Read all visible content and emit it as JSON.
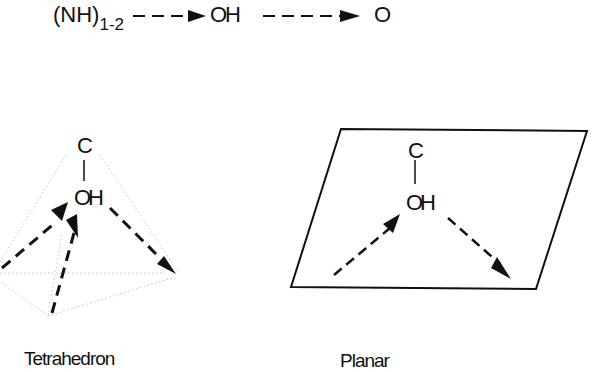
{
  "top_chain": {
    "donor": "(NH)",
    "donor_subscript": "1-2",
    "middle": "OH",
    "acceptor": "O"
  },
  "tetrahedron": {
    "atom_top": "C",
    "atom_center": "OH",
    "caption": "Tetrahedron"
  },
  "planar": {
    "atom_top": "C",
    "atom_center": "OH",
    "caption": "Planar"
  },
  "colors": {
    "ink": "#111111",
    "faint_edge": "#bdbdbd",
    "background": "#ffffff"
  }
}
